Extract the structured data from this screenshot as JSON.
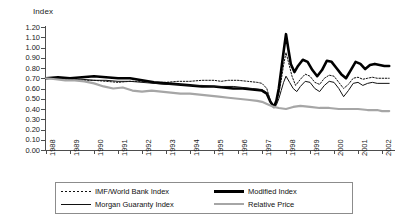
{
  "chart_data": {
    "type": "line",
    "title": "",
    "xlabel": "",
    "ylabel": "Index",
    "ylim": [
      0.0,
      1.2
    ],
    "ytick_step": 0.1,
    "grid": false,
    "legend_position": "bottom",
    "ytick_labels": [
      "1.20",
      "1.10",
      "1.00",
      "0.90",
      "0.80",
      "0.70",
      "0.60",
      "0.50",
      "0.40",
      "0.30",
      "0.20",
      "0.10",
      "0.00"
    ],
    "ytick_values": [
      1.2,
      1.1,
      1.0,
      0.9,
      0.8,
      0.7,
      0.6,
      0.5,
      0.4,
      0.3,
      0.2,
      0.1,
      0.0
    ],
    "categories": [
      "1988",
      "1989",
      "1990",
      "1991",
      "1992",
      "1993",
      "1994",
      "1995",
      "1996",
      "1997",
      "1998",
      "1999",
      "2000",
      "2001",
      "2002"
    ],
    "xlim": [
      1988,
      2002.5
    ],
    "series": [
      {
        "name": "IMF/World Bank Index",
        "style": "dotted",
        "color": "#111111",
        "width": 1.0,
        "x": [
          1988.0,
          1988.5,
          1989.0,
          1989.5,
          1990.0,
          1990.5,
          1991.0,
          1991.5,
          1992.0,
          1992.5,
          1993.0,
          1993.5,
          1994.0,
          1994.5,
          1995.0,
          1995.3,
          1995.6,
          1996.0,
          1996.4,
          1996.8,
          1997.0,
          1997.2,
          1997.35,
          1997.5,
          1997.6,
          1997.7,
          1997.8,
          1997.9,
          1998.0,
          1998.1,
          1998.25,
          1998.4,
          1998.6,
          1998.8,
          1999.0,
          1999.2,
          1999.4,
          1999.6,
          1999.8,
          2000.0,
          2000.2,
          2000.4,
          2000.6,
          2000.8,
          2001.0,
          2001.2,
          2001.4,
          2001.6,
          2001.8,
          2002.0,
          2002.3
        ],
        "values": [
          0.7,
          0.7,
          0.69,
          0.68,
          0.68,
          0.67,
          0.66,
          0.67,
          0.67,
          0.66,
          0.66,
          0.67,
          0.67,
          0.68,
          0.68,
          0.67,
          0.68,
          0.68,
          0.67,
          0.66,
          0.65,
          0.6,
          0.48,
          0.42,
          0.46,
          0.55,
          0.68,
          0.83,
          0.95,
          0.86,
          0.72,
          0.63,
          0.69,
          0.74,
          0.72,
          0.66,
          0.64,
          0.7,
          0.73,
          0.72,
          0.66,
          0.6,
          0.64,
          0.7,
          0.71,
          0.69,
          0.7,
          0.71,
          0.7,
          0.7,
          0.7
        ]
      },
      {
        "name": "Modified Index",
        "style": "solid",
        "color": "#000000",
        "width": 2.6,
        "x": [
          1988.0,
          1988.5,
          1989.0,
          1989.5,
          1990.0,
          1990.5,
          1991.0,
          1991.5,
          1992.0,
          1992.5,
          1993.0,
          1993.5,
          1994.0,
          1994.5,
          1995.0,
          1995.4,
          1995.8,
          1996.2,
          1996.6,
          1997.0,
          1997.2,
          1997.35,
          1997.5,
          1997.6,
          1997.7,
          1997.8,
          1997.9,
          1998.0,
          1998.1,
          1998.2,
          1998.35,
          1998.5,
          1998.7,
          1998.9,
          1999.1,
          1999.3,
          1999.5,
          1999.7,
          1999.9,
          2000.1,
          2000.3,
          2000.5,
          2000.7,
          2000.9,
          2001.1,
          2001.3,
          2001.5,
          2001.7,
          2001.9,
          2002.1,
          2002.3
        ],
        "values": [
          0.7,
          0.71,
          0.7,
          0.71,
          0.72,
          0.71,
          0.7,
          0.7,
          0.68,
          0.66,
          0.65,
          0.64,
          0.63,
          0.62,
          0.62,
          0.61,
          0.6,
          0.6,
          0.59,
          0.58,
          0.55,
          0.47,
          0.42,
          0.48,
          0.6,
          0.78,
          0.96,
          1.13,
          0.98,
          0.84,
          0.76,
          0.82,
          0.88,
          0.86,
          0.78,
          0.72,
          0.78,
          0.87,
          0.86,
          0.8,
          0.74,
          0.7,
          0.78,
          0.86,
          0.84,
          0.79,
          0.83,
          0.84,
          0.83,
          0.82,
          0.82
        ]
      },
      {
        "name": "Morgan Guaranty Index",
        "style": "solid",
        "color": "#111111",
        "width": 1.0,
        "x": [
          1988.0,
          1988.5,
          1989.0,
          1989.5,
          1990.0,
          1990.5,
          1991.0,
          1991.5,
          1992.0,
          1992.5,
          1993.0,
          1993.5,
          1994.0,
          1994.5,
          1995.0,
          1995.4,
          1995.8,
          1996.2,
          1996.6,
          1997.0,
          1997.2,
          1997.35,
          1997.5,
          1997.6,
          1997.7,
          1997.8,
          1997.9,
          1998.0,
          1998.15,
          1998.3,
          1998.45,
          1998.6,
          1998.8,
          1999.0,
          1999.2,
          1999.4,
          1999.6,
          1999.8,
          2000.0,
          2000.2,
          2000.4,
          2000.6,
          2000.8,
          2001.0,
          2001.2,
          2001.4,
          2001.6,
          2001.8,
          2002.0,
          2002.3
        ],
        "values": [
          0.7,
          0.7,
          0.69,
          0.69,
          0.68,
          0.68,
          0.67,
          0.67,
          0.66,
          0.65,
          0.64,
          0.64,
          0.63,
          0.63,
          0.62,
          0.62,
          0.62,
          0.61,
          0.6,
          0.59,
          0.56,
          0.47,
          0.41,
          0.44,
          0.5,
          0.58,
          0.66,
          0.72,
          0.66,
          0.6,
          0.57,
          0.62,
          0.67,
          0.66,
          0.6,
          0.57,
          0.63,
          0.67,
          0.66,
          0.6,
          0.52,
          0.58,
          0.65,
          0.66,
          0.63,
          0.65,
          0.66,
          0.65,
          0.65,
          0.65
        ]
      },
      {
        "name": "Relative Price",
        "style": "solid",
        "color": "#a6a6a6",
        "width": 2.2,
        "x": [
          1988.0,
          1988.4,
          1988.8,
          1989.2,
          1989.6,
          1990.0,
          1990.4,
          1990.8,
          1991.2,
          1991.6,
          1992.0,
          1992.4,
          1992.8,
          1993.2,
          1993.6,
          1994.0,
          1994.4,
          1994.8,
          1995.2,
          1995.6,
          1996.0,
          1996.4,
          1996.8,
          1997.0,
          1997.3,
          1997.5,
          1997.7,
          1998.0,
          1998.3,
          1998.6,
          1999.0,
          1999.4,
          1999.8,
          2000.2,
          2000.6,
          2001.0,
          2001.4,
          2001.8,
          2002.0,
          2002.3
        ],
        "values": [
          0.7,
          0.69,
          0.68,
          0.68,
          0.67,
          0.65,
          0.62,
          0.6,
          0.61,
          0.58,
          0.57,
          0.58,
          0.57,
          0.56,
          0.55,
          0.55,
          0.54,
          0.53,
          0.52,
          0.51,
          0.5,
          0.49,
          0.48,
          0.47,
          0.44,
          0.42,
          0.41,
          0.4,
          0.42,
          0.43,
          0.42,
          0.41,
          0.41,
          0.4,
          0.4,
          0.4,
          0.39,
          0.39,
          0.38,
          0.38
        ]
      }
    ]
  },
  "legend": {
    "items": [
      {
        "label": "IMF/World Bank Index",
        "swatch": "dotted-line-swatch"
      },
      {
        "label": "Modified Index",
        "swatch": "thick-black-line-swatch"
      },
      {
        "label": "Morgan Guaranty Index",
        "swatch": "thin-black-line-swatch"
      },
      {
        "label": "Relative Price",
        "swatch": "gray-line-swatch"
      }
    ]
  },
  "colors": {
    "axis": "#4d4d4d",
    "text": "#1a1a1a",
    "modified_index": "#000000",
    "imf_world_bank_index": "#111111",
    "morgan_guaranty_index": "#111111",
    "relative_price": "#a6a6a6",
    "background": "#ffffff"
  }
}
